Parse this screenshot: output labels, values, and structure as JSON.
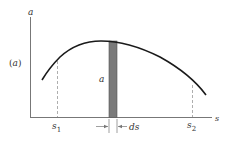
{
  "diagram": {
    "panel_label": "(a)",
    "y_axis_label": "a",
    "x_axis_label": "s",
    "strip_label": "a",
    "s1_label": "s",
    "s1_sub": "1",
    "s2_label": "s",
    "s2_sub": "2",
    "ds_label": "ds",
    "colors": {
      "curve": "#1a1a1a",
      "axis": "#666666",
      "strip_fill": "#7a7a7a",
      "dashed": "#999999"
    }
  }
}
